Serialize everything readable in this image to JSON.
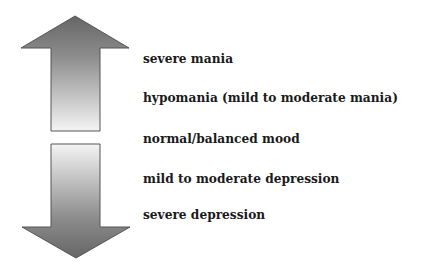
{
  "diagram": {
    "arrows": {
      "up": {
        "direction": "up",
        "meaning": "toward mania",
        "fill_top": "#6a6a6a",
        "fill_bottom": "#f2f2f2"
      },
      "down": {
        "direction": "down",
        "meaning": "toward depression",
        "fill_top": "#f2f2f2",
        "fill_bottom": "#6a6a6a"
      },
      "stroke": "#555555"
    },
    "labels": [
      {
        "text": "severe mania",
        "level": 5
      },
      {
        "text": "hypomania (mild to moderate mania)",
        "level": 4
      },
      {
        "text": "normal/balanced mood",
        "level": 3
      },
      {
        "text": "mild to moderate depression",
        "level": 2
      },
      {
        "text": "severe depression",
        "level": 1
      }
    ]
  }
}
